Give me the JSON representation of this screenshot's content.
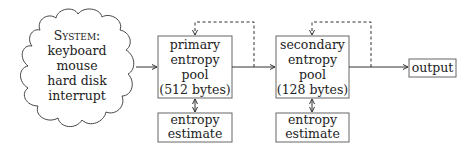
{
  "diagram": {
    "source": {
      "shape": "cloud",
      "title": "System:",
      "lines": [
        "keyboard",
        "mouse",
        "hard disk",
        "interrupt"
      ]
    },
    "primary_pool": {
      "lines": [
        "primary",
        "entropy",
        "pool",
        "(512 bytes)"
      ]
    },
    "primary_estimate": {
      "lines": [
        "entropy",
        "estimate"
      ]
    },
    "secondary_pool": {
      "lines": [
        "secondary",
        "entropy",
        "pool",
        "(128 bytes)"
      ]
    },
    "secondary_estimate": {
      "lines": [
        "entropy",
        "estimate"
      ]
    },
    "output": {
      "label": "output"
    },
    "edges": [
      {
        "from": "source",
        "to": "primary_pool",
        "style": "solid"
      },
      {
        "from": "primary_pool",
        "to": "secondary_pool",
        "style": "solid"
      },
      {
        "from": "primary_pool_output",
        "to": "primary_pool",
        "style": "dashed",
        "note": "feedback"
      },
      {
        "from": "primary_pool",
        "to": "primary_estimate",
        "style": "solid",
        "bidirectional": true
      },
      {
        "from": "secondary_pool",
        "to": "output",
        "style": "solid"
      },
      {
        "from": "secondary_pool_output",
        "to": "secondary_pool",
        "style": "dashed",
        "note": "feedback"
      },
      {
        "from": "secondary_pool",
        "to": "secondary_estimate",
        "style": "solid",
        "bidirectional": true
      }
    ],
    "colors": {
      "stroke": "#333333",
      "text": "#222222",
      "background": "#ffffff"
    }
  }
}
